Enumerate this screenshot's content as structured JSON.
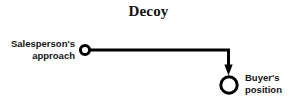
{
  "figure": {
    "title": "Decoy",
    "background_color": "#ffffff",
    "ink_color": "#000000",
    "width": 297,
    "height": 109
  },
  "nodes": {
    "salesperson": {
      "label_line1": "Salesperson's",
      "label_line2": "approach",
      "marker": "open-circle-small",
      "cx": 85,
      "cy": 50,
      "r": 4.6
    },
    "buyer": {
      "label_line1": "Buyer's",
      "label_line2": "position",
      "marker": "open-circle-large",
      "cx": 229,
      "cy": 85,
      "r": 8.2
    }
  },
  "connector": {
    "type": "elbow-arrow",
    "from": "salesperson",
    "to": "buyer",
    "arrowhead": "solid-triangle",
    "stroke_width": 3,
    "path": "M 90 50 L 228.5 50 L 228.5 68"
  }
}
